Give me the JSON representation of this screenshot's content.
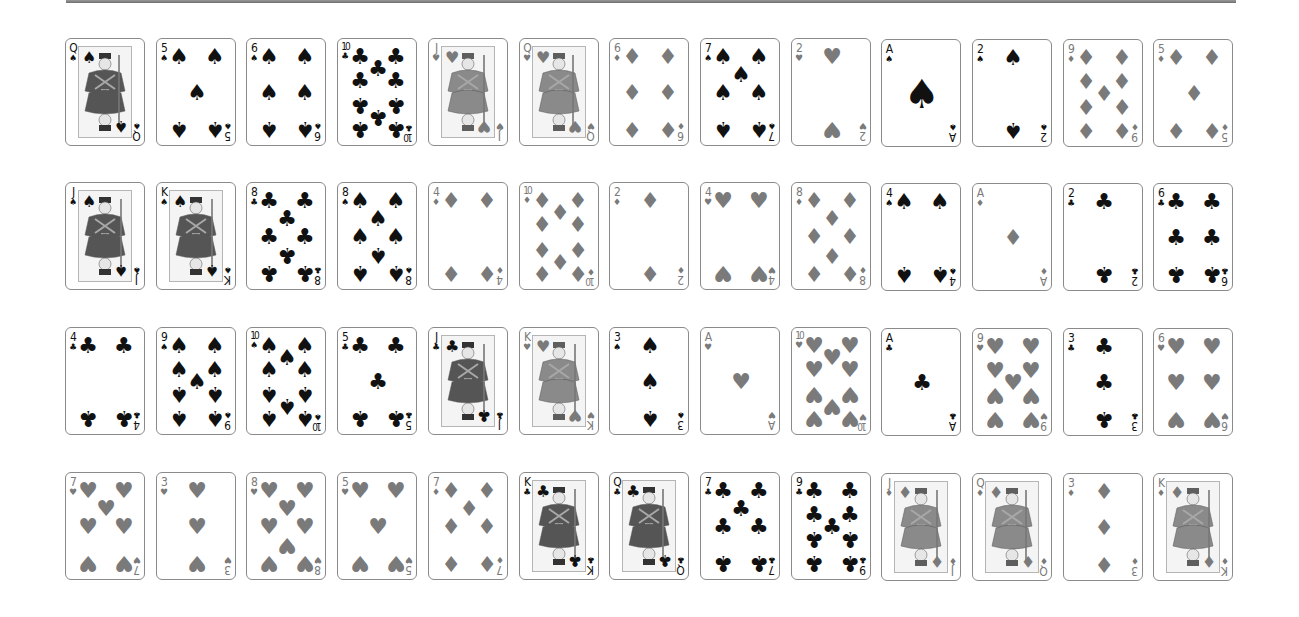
{
  "colors": {
    "red_suit": "#7a7a7a",
    "black_suit": "#111111",
    "card_border": "#8a8a8a",
    "background": "#ffffff",
    "top_bar": "#7a7a7a"
  },
  "suit_symbols": {
    "spades": "♠",
    "hearts": "♥",
    "diamonds": "♦",
    "clubs": "♣"
  },
  "layout": {
    "columns": 13,
    "rows": 4,
    "origin_x": 65,
    "row_y": [
      38,
      182,
      327,
      472
    ],
    "col_step": 90.7
  },
  "board": {
    "rows": [
      {
        "cards": [
          {
            "rank": "Q",
            "suit": "spades"
          },
          {
            "rank": "5",
            "suit": "spades"
          },
          {
            "rank": "6",
            "suit": "spades"
          },
          {
            "rank": "10",
            "suit": "clubs"
          },
          {
            "rank": "J",
            "suit": "hearts"
          },
          {
            "rank": "Q",
            "suit": "hearts"
          },
          {
            "rank": "6",
            "suit": "diamonds"
          },
          {
            "rank": "7",
            "suit": "spades"
          },
          {
            "rank": "2",
            "suit": "hearts"
          },
          {
            "rank": "A",
            "suit": "spades"
          },
          {
            "rank": "2",
            "suit": "spades"
          },
          {
            "rank": "9",
            "suit": "diamonds"
          },
          {
            "rank": "5",
            "suit": "diamonds"
          }
        ]
      },
      {
        "cards": [
          {
            "rank": "J",
            "suit": "spades"
          },
          {
            "rank": "K",
            "suit": "spades"
          },
          {
            "rank": "8",
            "suit": "clubs"
          },
          {
            "rank": "8",
            "suit": "spades"
          },
          {
            "rank": "4",
            "suit": "diamonds"
          },
          {
            "rank": "10",
            "suit": "diamonds"
          },
          {
            "rank": "2",
            "suit": "diamonds"
          },
          {
            "rank": "4",
            "suit": "hearts"
          },
          {
            "rank": "8",
            "suit": "diamonds"
          },
          {
            "rank": "4",
            "suit": "spades"
          },
          {
            "rank": "A",
            "suit": "diamonds"
          },
          {
            "rank": "2",
            "suit": "clubs"
          },
          {
            "rank": "6",
            "suit": "clubs"
          }
        ]
      },
      {
        "cards": [
          {
            "rank": "4",
            "suit": "clubs"
          },
          {
            "rank": "9",
            "suit": "spades"
          },
          {
            "rank": "10",
            "suit": "spades"
          },
          {
            "rank": "5",
            "suit": "clubs"
          },
          {
            "rank": "J",
            "suit": "clubs"
          },
          {
            "rank": "K",
            "suit": "hearts"
          },
          {
            "rank": "3",
            "suit": "spades"
          },
          {
            "rank": "A",
            "suit": "hearts"
          },
          {
            "rank": "10",
            "suit": "hearts"
          },
          {
            "rank": "A",
            "suit": "clubs"
          },
          {
            "rank": "9",
            "suit": "hearts"
          },
          {
            "rank": "3",
            "suit": "clubs"
          },
          {
            "rank": "6",
            "suit": "hearts"
          }
        ]
      },
      {
        "cards": [
          {
            "rank": "7",
            "suit": "hearts"
          },
          {
            "rank": "3",
            "suit": "hearts"
          },
          {
            "rank": "8",
            "suit": "hearts"
          },
          {
            "rank": "5",
            "suit": "hearts"
          },
          {
            "rank": "7",
            "suit": "diamonds"
          },
          {
            "rank": "K",
            "suit": "clubs"
          },
          {
            "rank": "Q",
            "suit": "clubs"
          },
          {
            "rank": "7",
            "suit": "clubs"
          },
          {
            "rank": "9",
            "suit": "clubs"
          },
          {
            "rank": "J",
            "suit": "diamonds"
          },
          {
            "rank": "Q",
            "suit": "diamonds"
          },
          {
            "rank": "3",
            "suit": "diamonds"
          },
          {
            "rank": "K",
            "suit": "diamonds"
          }
        ]
      }
    ]
  }
}
